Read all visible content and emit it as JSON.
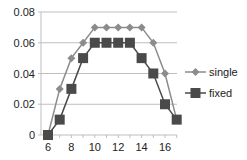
{
  "chart_data": {
    "type": "line",
    "title": "",
    "xlabel": "",
    "ylabel": "",
    "x": [
      6,
      7,
      8,
      9,
      10,
      11,
      12,
      13,
      14,
      15,
      16,
      17
    ],
    "series": [
      {
        "name": "single",
        "marker": "diamond",
        "color": "#8c8c8c",
        "values": [
          0,
          0.03,
          0.05,
          0.06,
          0.07,
          0.07,
          0.07,
          0.07,
          0.07,
          0.06,
          0.04,
          0.01
        ]
      },
      {
        "name": "fixed",
        "marker": "square",
        "color": "#4a4a4a",
        "values": [
          0,
          0.01,
          0.03,
          0.05,
          0.06,
          0.06,
          0.06,
          0.06,
          0.05,
          0.04,
          0.02,
          0.01
        ]
      }
    ],
    "xticks": [
      "6",
      "8",
      "10",
      "12",
      "14",
      "16"
    ],
    "yticks": [
      "0",
      "0.02",
      "0.04",
      "0.06",
      "0.08"
    ],
    "xlim": [
      6,
      17
    ],
    "ylim": [
      0,
      0.08
    ],
    "grid": {
      "horizontal": true,
      "vertical": false,
      "color": "#bfbfbf"
    },
    "legend_position": "right"
  }
}
